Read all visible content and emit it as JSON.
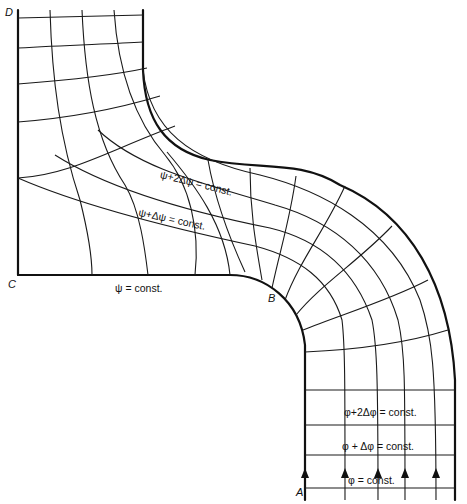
{
  "figure": {
    "type": "flow-net",
    "points": {
      "A": "A",
      "B": "B",
      "C": "C",
      "D": "D"
    },
    "labels": {
      "psi_const": "ψ = const.",
      "psi_plus_dpsi": "ψ+Δψ = const.",
      "psi_plus_2dpsi": "ψ+2Δψ = const.",
      "phi_const": "φ = const.",
      "phi_plus_dphi": "φ + Δφ = const.",
      "phi_plus_2dphi": "φ+2Δφ = const."
    },
    "flow_arrows": 5,
    "colors": {
      "line": "#111111",
      "background": "#ffffff"
    }
  }
}
